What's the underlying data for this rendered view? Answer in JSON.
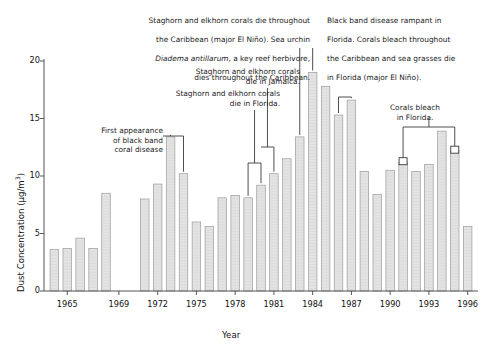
{
  "chart_data": {
    "type": "bar",
    "title": "",
    "xlabel": "Year",
    "ylabel": "Dust Concentration (µg/m³)",
    "ylabel_base": "Dust Concentration (µg/m",
    "ylabel_exp": "3",
    "ylabel_tail": ")",
    "ylim": [
      0,
      20
    ],
    "yticks": [
      0,
      5,
      10,
      15,
      20
    ],
    "ytick_labels": [
      "0",
      "5",
      "10",
      "15",
      "20"
    ],
    "xlim": [
      1963.2,
      1996.8
    ],
    "xticks": [
      1965,
      1969,
      1972,
      1975,
      1978,
      1981,
      1984,
      1987,
      1990,
      1993,
      1996
    ],
    "xtick_labels": [
      "1965",
      "1969",
      "1972",
      "1975",
      "1978",
      "1981",
      "1984",
      "1987",
      "1990",
      "1993",
      "1996"
    ],
    "grid": false,
    "legend": "none",
    "bar_fill": "#e3e3e3",
    "bar_edge": "#9a9a9a",
    "axis_color": "#555555",
    "categories": [
      1964,
      1965,
      1966,
      1967,
      1968,
      1969,
      1970,
      1971,
      1972,
      1973,
      1974,
      1975,
      1976,
      1977,
      1978,
      1979,
      1980,
      1981,
      1982,
      1983,
      1984,
      1985,
      1986,
      1987,
      1988,
      1989,
      1990,
      1991,
      1992,
      1993,
      1994,
      1995,
      1996
    ],
    "values": [
      3.6,
      3.7,
      4.6,
      3.7,
      8.5,
      null,
      null,
      8.0,
      9.3,
      13.4,
      10.2,
      6.0,
      5.6,
      8.1,
      8.3,
      8.1,
      9.2,
      10.2,
      11.5,
      13.4,
      19.0,
      17.8,
      15.3,
      16.6,
      10.4,
      8.4,
      10.5,
      11.2,
      10.4,
      11.0,
      13.9,
      12.2,
      5.6
    ],
    "missing_years": [
      1969,
      1970
    ],
    "annotations": [
      {
        "id": "first-appearance-black-band",
        "text": "First appearance\nof black band\ncoral disease",
        "align": "right",
        "target_years": [
          1973,
          1974
        ],
        "bracket": "double"
      },
      {
        "id": "staghorn-elkhorn-florida",
        "text": "Staghorn and elkhorn corals\ndie in Florida.",
        "align": "right",
        "target_years": [
          1979,
          1980
        ],
        "bracket": "double"
      },
      {
        "id": "staghorn-elkhorn-jamaica",
        "text": "Staghorn and elkhorn corals\ndie in Jamaica.",
        "align": "right",
        "target_years": [
          1980,
          1981
        ],
        "bracket": "double"
      },
      {
        "id": "caribbean-diadema-dieoff",
        "text_before": "Staghorn and elkhorn corals die throughout\nthe Caribbean (major El Niño). Sea urchin\n",
        "species": "Diadema antillarum",
        "text_after": ", a key reef herbivore,\ndies throughout the Caribbean.",
        "align": "right",
        "target_years": [
          1983
        ],
        "bracket": "single"
      },
      {
        "id": "black-band-rampant-florida",
        "text": "Black band disease rampant in\nFlorida. Corals bleach throughout\nthe Caribbean and sea grasses die\nin Florida (major El Niño).",
        "align": "left",
        "target_years": [
          1984
        ],
        "bracket": "single"
      },
      {
        "id": "bleach-1986-1987",
        "text": "",
        "align": "center",
        "target_years": [
          1986,
          1987
        ],
        "bracket": "double"
      },
      {
        "id": "corals-bleach-florida",
        "text": "Corals bleach\nin Florida.",
        "align": "center",
        "target_years": [
          1991,
          1995
        ],
        "bracket": "double"
      }
    ]
  },
  "annotation_text": {
    "first_appearance": "First appearance\nof black band\ncoral disease",
    "staghorn_florida": "Staghorn and elkhorn corals\ndie in Florida.",
    "staghorn_jamaica": "Staghorn and elkhorn corals\ndie in Jamaica.",
    "caribbean_line1": "Staghorn and elkhorn corals die throughout",
    "caribbean_line2": "the Caribbean (major El Niño). Sea urchin",
    "caribbean_species": "Diadema antillarum",
    "caribbean_line3_tail": ", a key reef herbivore,",
    "caribbean_line4": "dies throughout the Caribbean.",
    "blackband_line1": "Black band disease rampant in",
    "blackband_line2": "Florida. Corals bleach throughout",
    "blackband_line3": "the Caribbean and sea grasses die",
    "blackband_line4": "in Florida (major El Niño).",
    "corals_bleach_florida": "Corals bleach\nin Florida."
  }
}
